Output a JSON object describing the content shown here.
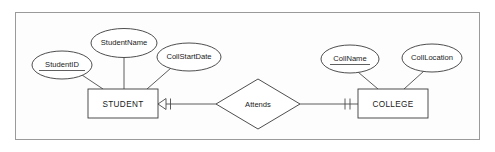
{
  "diagram": {
    "kind": "entity-relationship-diagram",
    "title": "",
    "background_color": "#fdfdfd",
    "border_color": "#9a9a9a",
    "shape_stroke_color": "#3a3a3a",
    "connector_color": "#4a4a4a",
    "text_color": "#1a1a1a"
  },
  "entities": [
    {
      "id": "student",
      "label": "STUDENT",
      "shape": "rectangle",
      "x": 88,
      "y": 89,
      "width": 70,
      "height": 29
    },
    {
      "id": "college",
      "label": "COLLEGE",
      "shape": "rectangle",
      "x": 358,
      "y": 89,
      "width": 70,
      "height": 29
    }
  ],
  "attributes": [
    {
      "id": "student-id",
      "label": "StudentID",
      "owner": "student",
      "primary_key": true,
      "shape": "ellipse",
      "cx": 62,
      "cy": 65,
      "rx": 30,
      "ry": 14
    },
    {
      "id": "student-name",
      "label": "StudentName",
      "owner": "student",
      "primary_key": false,
      "shape": "ellipse",
      "cx": 124,
      "cy": 43,
      "rx": 33,
      "ry": 14.5
    },
    {
      "id": "coll-start-date",
      "label": "CollStartDate",
      "owner": "student",
      "primary_key": false,
      "shape": "ellipse",
      "cx": 189,
      "cy": 57,
      "rx": 32,
      "ry": 14
    },
    {
      "id": "coll-name",
      "label": "CollName",
      "owner": "college",
      "primary_key": true,
      "shape": "ellipse",
      "cx": 350,
      "cy": 59,
      "rx": 29,
      "ry": 14
    },
    {
      "id": "coll-location",
      "label": "CollLocation",
      "owner": "college",
      "primary_key": false,
      "shape": "ellipse",
      "cx": 432,
      "cy": 58,
      "rx": 30,
      "ry": 14
    }
  ],
  "relationships": [
    {
      "id": "attends",
      "label": "Attends",
      "shape": "diamond",
      "cx": 258,
      "cy": 104,
      "half_width": 42,
      "half_height": 25,
      "from": "student",
      "to": "college",
      "from_cardinality": "many (crow's foot, mandatory)",
      "to_cardinality": "one and only one (double tick)"
    }
  ]
}
